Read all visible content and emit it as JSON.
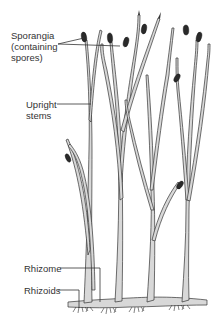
{
  "figure": {
    "labels": {
      "sporangia_line1": "Sporangia",
      "sporangia_line2": "(containing",
      "sporangia_line3": "spores)",
      "upright_line1": "Upright",
      "upright_line2": "stems",
      "rhizome": "Rhizome",
      "rhizoids": "Rhizoids"
    },
    "colors": {
      "stem_fill": "#d8d8d8",
      "outline": "#333333",
      "sporangium": "#2a2a2a",
      "background": "#ffffff"
    }
  }
}
